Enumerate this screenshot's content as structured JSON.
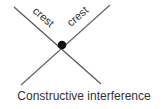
{
  "diagram": {
    "labels": {
      "crest_left": "crest",
      "crest_right": "crest"
    },
    "caption": "Constructive interference",
    "colors": {
      "line": "#444444",
      "dot": "#111111",
      "text": "#333333"
    }
  }
}
